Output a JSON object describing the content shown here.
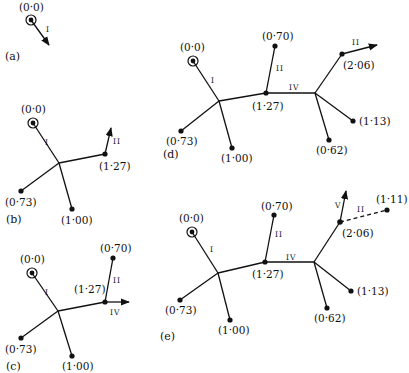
{
  "figure": {
    "panels": [
      {
        "id": "a",
        "label": "(a)",
        "root": "(0·0)",
        "arrows": [
          "I"
        ]
      },
      {
        "id": "b",
        "label": "(b)",
        "root": "(0·0)",
        "edges": [
          "I",
          "II"
        ],
        "nodes": [
          "(1·27)",
          "(0·73)",
          "(1·00)"
        ]
      },
      {
        "id": "c",
        "label": "(c)",
        "root": "(0·0)",
        "edges": [
          "I",
          "II",
          "IV"
        ],
        "nodes": [
          "(1·27)",
          "(0·70)",
          "(0·73)",
          "(1·00)"
        ]
      },
      {
        "id": "d",
        "label": "(d)",
        "root": "(0·0)",
        "edges": [
          "I",
          "II",
          "IV",
          "II"
        ],
        "nodes": [
          "(0·70)",
          "(1·27)",
          "(2·06)",
          "(0·73)",
          "(1·00)",
          "(0·62)",
          "(1·13)"
        ]
      },
      {
        "id": "e",
        "label": "(e)",
        "root": "(0·0)",
        "edges": [
          "I",
          "II",
          "IV",
          "V",
          "II"
        ],
        "nodes": [
          "(0·70)",
          "(1·27)",
          "(2·06)",
          "(1·11)",
          "(0·73)",
          "(1·00)",
          "(0·62)",
          "(1·13)"
        ]
      }
    ]
  },
  "text": {
    "root": "(0·0)",
    "n070": "(0·70)",
    "n073": "(0·73)",
    "n100": "(1·00)",
    "n127": "(1·27)",
    "n206": "(2·06)",
    "n062": "(0·62)",
    "n113": "(1·13)",
    "n111": "(1·11)",
    "r1": "I",
    "r2": "II",
    "r4": "IV",
    "r5": "V",
    "pa": "(a)",
    "pb": "(b)",
    "pc": "(c)",
    "pd": "(d)",
    "pe": "(e)"
  }
}
